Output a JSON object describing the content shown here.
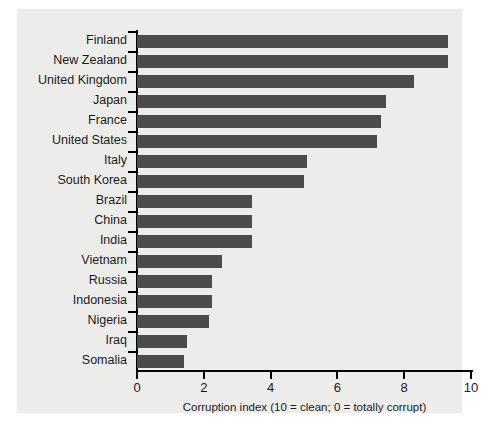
{
  "chart_data": {
    "type": "bar",
    "orientation": "horizontal",
    "title": "",
    "xlabel": "Corruption index (10 = clean; 0 = totally corrupt)",
    "ylabel": "",
    "xlim": [
      0,
      10
    ],
    "xticks": [
      "0",
      "2",
      "4",
      "6",
      "8",
      "10"
    ],
    "grid": false,
    "legend": null,
    "bar_color": "#4b4b4b",
    "panel_color": "#ececeb",
    "axis_color": "#000000",
    "categories": [
      "Finland",
      "New Zealand",
      "United Kingdom",
      "Japan",
      "France",
      "United States",
      "Italy",
      "South Korea",
      "Brazil",
      "China",
      "India",
      "Vietnam",
      "Russia",
      "Indonesia",
      "Nigeria",
      "Iraq",
      "Somalia"
    ],
    "values": [
      9.3,
      9.3,
      8.3,
      7.45,
      7.3,
      7.2,
      5.1,
      5.0,
      3.45,
      3.45,
      3.45,
      2.55,
      2.25,
      2.25,
      2.15,
      1.5,
      1.4
    ]
  }
}
